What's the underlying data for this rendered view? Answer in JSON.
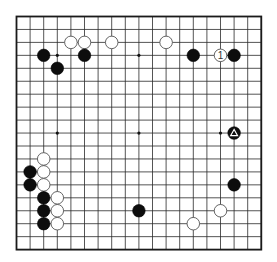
{
  "board": {
    "size": 19,
    "origin": {
      "x": 16.5,
      "y": 16.5
    },
    "cell": {
      "w": 13.6,
      "h": 12.95
    },
    "line_color": "#2a2a2a",
    "border_color": "#1a1a1a",
    "background": "#ffffff",
    "star_points": [
      [
        3,
        3
      ],
      [
        9,
        3
      ],
      [
        15,
        3
      ],
      [
        3,
        9
      ],
      [
        9,
        9
      ],
      [
        15,
        9
      ],
      [
        3,
        15
      ],
      [
        9,
        15
      ],
      [
        15,
        15
      ]
    ]
  },
  "stones": [
    {
      "color": "white",
      "col": 4,
      "row": 2
    },
    {
      "color": "white",
      "col": 5,
      "row": 2
    },
    {
      "color": "white",
      "col": 7,
      "row": 2
    },
    {
      "color": "white",
      "col": 11,
      "row": 2
    },
    {
      "color": "black",
      "col": 2,
      "row": 3
    },
    {
      "color": "black",
      "col": 5,
      "row": 3
    },
    {
      "color": "black",
      "col": 3,
      "row": 4
    },
    {
      "color": "black",
      "col": 13,
      "row": 3
    },
    {
      "color": "white",
      "col": 15,
      "row": 3,
      "label": "1"
    },
    {
      "color": "black",
      "col": 16,
      "row": 3
    },
    {
      "color": "black",
      "col": 16,
      "row": 9,
      "marker": "triangle"
    },
    {
      "color": "white",
      "col": 2,
      "row": 11
    },
    {
      "color": "black",
      "col": 1,
      "row": 12
    },
    {
      "color": "white",
      "col": 2,
      "row": 12
    },
    {
      "color": "black",
      "col": 1,
      "row": 13
    },
    {
      "color": "white",
      "col": 2,
      "row": 13
    },
    {
      "color": "black",
      "col": 2,
      "row": 14
    },
    {
      "color": "white",
      "col": 3,
      "row": 14
    },
    {
      "color": "black",
      "col": 2,
      "row": 15
    },
    {
      "color": "white",
      "col": 3,
      "row": 15
    },
    {
      "color": "black",
      "col": 2,
      "row": 16
    },
    {
      "color": "white",
      "col": 3,
      "row": 16
    },
    {
      "color": "black",
      "col": 16,
      "row": 13
    },
    {
      "color": "black",
      "col": 9,
      "row": 15
    },
    {
      "color": "white",
      "col": 15,
      "row": 15
    },
    {
      "color": "white",
      "col": 13,
      "row": 16
    }
  ]
}
